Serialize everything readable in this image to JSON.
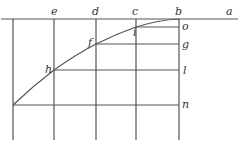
{
  "diagram": {
    "type": "geometric-construction",
    "labels": {
      "a": "a",
      "b": "b",
      "c": "c",
      "d": "d",
      "e": "e",
      "f": "f",
      "g": "g",
      "h": "h",
      "i": "i",
      "l": "l",
      "n": "n",
      "o": "o"
    },
    "line_color": "#555555",
    "curve_points": [
      [
        13,
        105
      ],
      [
        54,
        70
      ],
      [
        96,
        44
      ],
      [
        136,
        27
      ],
      [
        179,
        19
      ]
    ]
  }
}
